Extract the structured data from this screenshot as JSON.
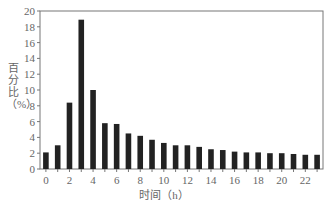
{
  "chart_data": {
    "type": "bar",
    "title": "",
    "xlabel": "时间（h）",
    "ylabel": "百分比（%）",
    "categories": [
      0,
      1,
      2,
      3,
      4,
      5,
      6,
      7,
      8,
      9,
      10,
      11,
      12,
      13,
      14,
      15,
      16,
      17,
      18,
      19,
      20,
      21,
      22,
      23
    ],
    "values": [
      2.1,
      3.0,
      8.4,
      18.9,
      10.0,
      5.8,
      5.7,
      4.5,
      4.2,
      3.7,
      3.3,
      3.0,
      3.0,
      2.8,
      2.5,
      2.4,
      2.2,
      2.1,
      2.1,
      2.0,
      2.0,
      1.9,
      1.8,
      1.8
    ],
    "ylim": [
      0,
      20
    ],
    "yticks": [
      0,
      2,
      4,
      6,
      8,
      10,
      12,
      14,
      16,
      18,
      20
    ],
    "xticks": [
      0,
      2,
      4,
      6,
      8,
      10,
      12,
      14,
      16,
      18,
      20,
      22
    ],
    "grid": false,
    "legend": null,
    "bar_color": "#222222"
  }
}
